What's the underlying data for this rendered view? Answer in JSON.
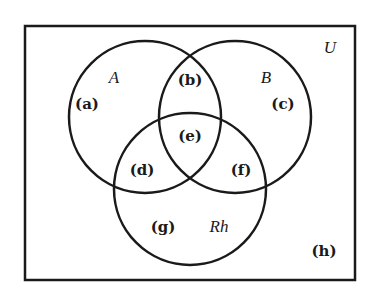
{
  "diagram": {
    "type": "venn",
    "universe_label": "U",
    "sets": [
      {
        "label": "A",
        "cx": 145,
        "cy": 117,
        "r": 76
      },
      {
        "label": "B",
        "cx": 235,
        "cy": 117,
        "r": 76
      },
      {
        "label": "Rh",
        "cx": 190,
        "cy": 189,
        "r": 76
      }
    ],
    "regions": [
      {
        "id": "a",
        "label": "(a)",
        "x": 87,
        "y": 109,
        "description": "A only"
      },
      {
        "id": "b",
        "label": "(b)",
        "x": 190,
        "y": 85,
        "description": "A and B only"
      },
      {
        "id": "c",
        "label": "(c)",
        "x": 283,
        "y": 109,
        "description": "B only"
      },
      {
        "id": "d",
        "label": "(d)",
        "x": 142,
        "y": 175,
        "description": "A and Rh only"
      },
      {
        "id": "e",
        "label": "(e)",
        "x": 190,
        "y": 141,
        "description": "A, B and Rh"
      },
      {
        "id": "f",
        "label": "(f)",
        "x": 241,
        "y": 175,
        "description": "B and Rh only"
      },
      {
        "id": "g",
        "label": "(g)",
        "x": 163,
        "y": 232,
        "description": "Rh only"
      },
      {
        "id": "h",
        "label": "(h)",
        "x": 324,
        "y": 256,
        "description": "outside all sets"
      }
    ],
    "set_label_positions": {
      "A": {
        "x": 114,
        "y": 83
      },
      "B": {
        "x": 266,
        "y": 83
      },
      "Rh": {
        "x": 219,
        "y": 232
      },
      "U": {
        "x": 330,
        "y": 53
      }
    },
    "frame": {
      "x": 25,
      "y": 26,
      "width": 330,
      "height": 254
    },
    "stroke_color": "#1a1a1a",
    "background": "#ffffff"
  }
}
